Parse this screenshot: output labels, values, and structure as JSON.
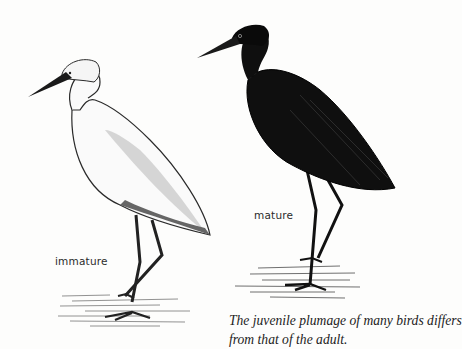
{
  "figure": {
    "labels": {
      "immature": "immature",
      "mature": "mature"
    },
    "caption": {
      "line1": "The juvenile plumage of many birds differs",
      "line2": "from that of the adult."
    },
    "birds": [
      {
        "name": "immature-heron",
        "color": "#ffffff",
        "outline": "#2a2a2a"
      },
      {
        "name": "mature-heron",
        "color": "#111111",
        "outline": "#000000"
      }
    ]
  }
}
